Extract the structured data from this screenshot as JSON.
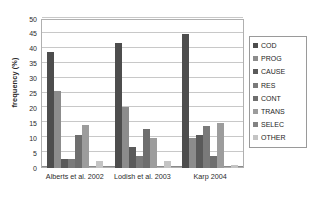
{
  "chart_data": {
    "type": "bar",
    "title": "",
    "xlabel": "",
    "ylabel": "frequency (%)",
    "ylim": [
      0,
      50
    ],
    "yticks": [
      0,
      5,
      10,
      15,
      20,
      25,
      30,
      35,
      40,
      45,
      50
    ],
    "grid": true,
    "legend_position": "right",
    "categories": [
      "Alberts et al. 2002",
      "Lodish et al. 2003",
      "Karp 2004"
    ],
    "series": [
      {
        "name": "COD",
        "color": "#4d4d4d",
        "values": [
          39,
          42,
          45
        ]
      },
      {
        "name": "PROG",
        "color": "#8c8c8c",
        "values": [
          26,
          20.5,
          10
        ]
      },
      {
        "name": "CAUSE",
        "color": "#5a5a5a",
        "values": [
          3,
          7,
          11
        ]
      },
      {
        "name": "RES",
        "color": "#7a7a7a",
        "values": [
          3,
          4,
          14
        ]
      },
      {
        "name": "CONT",
        "color": "#6e6e6e",
        "values": [
          11,
          13,
          4
        ]
      },
      {
        "name": "TRANS",
        "color": "#9c9c9c",
        "values": [
          14.5,
          10,
          15
        ]
      },
      {
        "name": "SELEC",
        "color": "#828282",
        "values": [
          0,
          0,
          0
        ]
      },
      {
        "name": "OTHER",
        "color": "#c4c4c4",
        "values": [
          2.5,
          2.5,
          1
        ]
      }
    ]
  },
  "legend": {
    "items": [
      {
        "label": "COD"
      },
      {
        "label": "PROG"
      },
      {
        "label": "CAUSE"
      },
      {
        "label": "RES"
      },
      {
        "label": "CONT"
      },
      {
        "label": "TRANS"
      },
      {
        "label": "SELEC"
      },
      {
        "label": "OTHER"
      }
    ]
  },
  "colors": {
    "gridline": "#c8c8c8",
    "frame": "#b0b0b0",
    "text": "#2b2b2b",
    "background": "#ffffff"
  }
}
